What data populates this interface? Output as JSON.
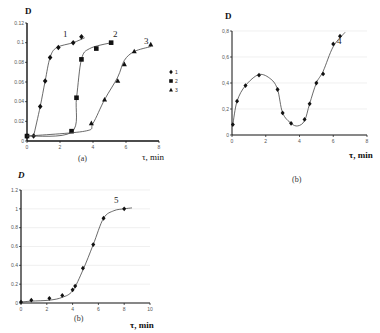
{
  "chart_data": [
    {
      "type": "scatter",
      "panel": "(a)",
      "ylabel": "D",
      "xlabel": "τ, min",
      "xlim": [
        0,
        8
      ],
      "ylim": [
        0,
        0.12
      ],
      "xticks": [
        "0",
        "2",
        "4",
        "6",
        "8"
      ],
      "yticks": [
        "0",
        "0.02",
        "0.04",
        "0.06",
        "0.08",
        "0.1",
        "0.12"
      ],
      "legend": [
        "1",
        "2",
        "3"
      ],
      "legend_position": "right",
      "series": [
        {
          "name": "1",
          "marker": "diamond",
          "x": [
            0,
            0.4,
            0.8,
            1.1,
            1.4,
            1.9,
            2.8,
            3.3
          ],
          "y": [
            0.005,
            0.005,
            0.035,
            0.061,
            0.085,
            0.095,
            0.1,
            0.106
          ]
        },
        {
          "name": "2",
          "marker": "square",
          "x": [
            0,
            2.7,
            3.0,
            3.3,
            4.2,
            5.1
          ],
          "y": [
            0.005,
            0.01,
            0.044,
            0.083,
            0.094,
            0.1
          ]
        },
        {
          "name": "3",
          "marker": "triangle",
          "x": [
            3.9,
            4.7,
            5.5,
            5.9,
            6.5,
            7.5
          ],
          "y": [
            0.018,
            0.042,
            0.061,
            0.078,
            0.091,
            0.098
          ]
        }
      ]
    },
    {
      "type": "scatter",
      "panel": "(b)",
      "ylabel": "D",
      "xlabel": "τ, min",
      "xlim": [
        0,
        8
      ],
      "ylim": [
        0,
        0.8
      ],
      "xticks": [
        "0",
        "2",
        "4",
        "6",
        "8"
      ],
      "yticks": [
        "0",
        "0,2",
        "0,4",
        "0,6",
        "0,8"
      ],
      "series": [
        {
          "name": "4",
          "marker": "diamond",
          "x": [
            0.05,
            0.3,
            0.8,
            1.6,
            2.7,
            3.0,
            3.5,
            4.3,
            4.6,
            5.0,
            5.4,
            6.0,
            6.4
          ],
          "y": [
            0.08,
            0.26,
            0.38,
            0.46,
            0.35,
            0.17,
            0.09,
            0.12,
            0.24,
            0.4,
            0.47,
            0.7,
            0.76
          ]
        }
      ]
    },
    {
      "type": "scatter",
      "panel": "(b)",
      "ylabel": "D",
      "xlabel": "τ, min",
      "xlim": [
        0,
        10
      ],
      "ylim": [
        0,
        1.2
      ],
      "xticks": [
        "0",
        "2",
        "4",
        "6",
        "8",
        "10"
      ],
      "yticks": [
        "0",
        "0.2",
        "0.4",
        "0.6",
        "0.8",
        "1",
        "1.2"
      ],
      "series": [
        {
          "name": "5",
          "marker": "diamond",
          "x": [
            0,
            0.8,
            2.2,
            3.2,
            4.0,
            4.2,
            4.8,
            5.6,
            6.4,
            8.0
          ],
          "y": [
            0.01,
            0.03,
            0.05,
            0.08,
            0.14,
            0.18,
            0.37,
            0.62,
            0.9,
            1.0
          ]
        }
      ]
    }
  ],
  "labels": {
    "a": {
      "ylabel": "D",
      "xlabel": "τ, min",
      "caption": "(a)",
      "curve1": "1",
      "curve2": "2",
      "curve3": "3"
    },
    "b": {
      "ylabel": "D",
      "xlabel": "τ, min",
      "caption": "(b)",
      "curve4": "4"
    },
    "c": {
      "ylabel": "D",
      "xlabel": "τ, min",
      "caption": "(b)",
      "curve5": "5"
    }
  }
}
